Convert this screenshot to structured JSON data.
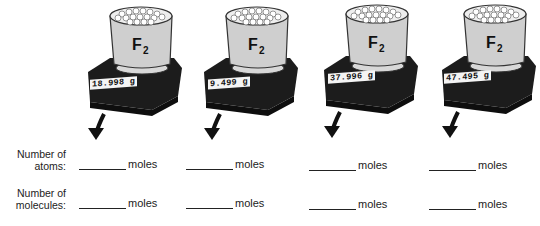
{
  "scales": [
    {
      "substance": "F",
      "subscript": "2",
      "reading": "18.998 g"
    },
    {
      "substance": "F",
      "subscript": "2",
      "reading": "9.499 g"
    },
    {
      "substance": "F",
      "subscript": "2",
      "reading": "37.996 g"
    },
    {
      "substance": "F",
      "subscript": "2",
      "reading": "47.495 g"
    }
  ],
  "rows": [
    {
      "label_line1": "Number of",
      "label_line2": "atoms:",
      "unit": "moles"
    },
    {
      "label_line1": "Number of",
      "label_line2": "molecules:",
      "unit": "moles"
    }
  ]
}
